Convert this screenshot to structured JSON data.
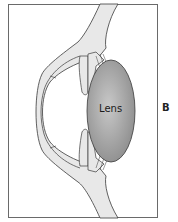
{
  "diagram": {
    "panel_label": "B",
    "labels": {
      "lens": "Lens"
    },
    "colors": {
      "tissue": "#e8e8e8",
      "outline": "#3a3a3a",
      "lens_center": "#b4b4b4",
      "lens_edge": "#8e8e8e"
    },
    "structures": [
      "cornea",
      "sclera",
      "iris",
      "ciliary-body",
      "zonules",
      "lens",
      "anterior-chamber"
    ]
  }
}
